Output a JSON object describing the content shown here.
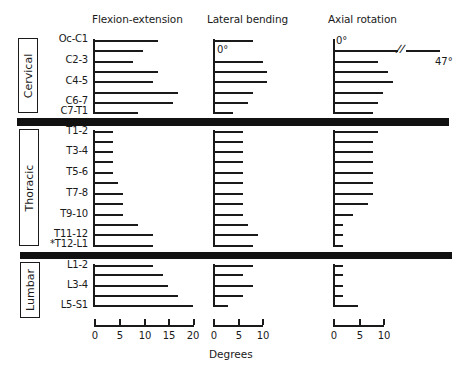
{
  "chart_data": {
    "type": "bar",
    "orientation": "horizontal",
    "title": "",
    "xlabel": "Degrees",
    "ylabel": "",
    "regions": [
      {
        "name": "Cervical",
        "levels": [
          "Oc-C1",
          "C1-2",
          "C2-3",
          "C3-4",
          "C4-5",
          "C5-6",
          "C6-7",
          "C7-T1"
        ]
      },
      {
        "name": "Thoracic",
        "levels": [
          "T1-2",
          "T2-3",
          "T3-4",
          "T4-5",
          "T5-6",
          "T6-7",
          "T7-8",
          "T8-9",
          "T9-10",
          "T10-11",
          "T11-12",
          "*T12-L1"
        ]
      },
      {
        "name": "Lumbar",
        "levels": [
          "L1-2",
          "L2-3",
          "L3-4",
          "L4-5",
          "L5-S1"
        ]
      }
    ],
    "categories": [
      "Oc-C1",
      "C1-2",
      "C2-3",
      "C3-4",
      "C4-5",
      "C5-6",
      "C6-7",
      "C7-T1",
      "T1-2",
      "T2-3",
      "T3-4",
      "T4-5",
      "T5-6",
      "T6-7",
      "T7-8",
      "T8-9",
      "T9-10",
      "T10-11",
      "T11-12",
      "T12-L1",
      "L1-2",
      "L2-3",
      "L3-4",
      "L4-5",
      "L5-S1"
    ],
    "series": [
      {
        "name": "Flexion-extension",
        "xlim": [
          0,
          20
        ],
        "ticks": [
          0,
          5,
          10,
          15,
          20
        ],
        "values": [
          13,
          10,
          8,
          13,
          12,
          17,
          16,
          9,
          4,
          4,
          4,
          4,
          4,
          5,
          6,
          6,
          6,
          9,
          12,
          12,
          12,
          14,
          15,
          17,
          20
        ]
      },
      {
        "name": "Lateral bending",
        "xlim": [
          0,
          10
        ],
        "ticks": [
          0,
          5,
          10
        ],
        "values": [
          8,
          0,
          10,
          11,
          11,
          8,
          7,
          4,
          6,
          6,
          6,
          6,
          6,
          6,
          6,
          6,
          6,
          7,
          9,
          8,
          8,
          6,
          8,
          6,
          3
        ]
      },
      {
        "name": "Axial rotation",
        "xlim": [
          0,
          10
        ],
        "ticks": [
          0,
          5,
          10
        ],
        "values": [
          0,
          47,
          9,
          11,
          12,
          10,
          9,
          8,
          9,
          8,
          8,
          8,
          8,
          8,
          8,
          7,
          4,
          2,
          2,
          2,
          2,
          2,
          2,
          2,
          5
        ]
      }
    ],
    "annotations": [
      "0°",
      "0°",
      "47°"
    ],
    "grid": false,
    "legend": "none"
  },
  "headers": {
    "flexion": "Flexion-extension",
    "lateral": "Lateral bending",
    "axial": "Axial rotation"
  },
  "regions": {
    "cervical": "Cervical",
    "thoracic": "Thoracic",
    "lumbar": "Lumbar"
  },
  "level_labels": {
    "oc_c1": "Oc-C1",
    "c2_3": "C2-3",
    "c4_5": "C4-5",
    "c6_7": "C6-7",
    "c7_t1": "C7-T1",
    "t1_2": "T1-2",
    "t3_4": "T3-4",
    "t5_6": "T5-6",
    "t7_8": "T7-8",
    "t9_10": "T9-10",
    "t11_12": "T11-12",
    "t12_l1": "*T12-L1",
    "l1_2": "L1-2",
    "l3_4": "L3-4",
    "l5_s1": "L5-S1"
  },
  "notes": {
    "lateral_zero": "0°",
    "axial_zero": "0°",
    "axial_47": "47°",
    "break_mark": "//"
  },
  "axes": {
    "flexion_ticks": [
      "0",
      "5",
      "10",
      "15",
      "20"
    ],
    "lateral_ticks": [
      "0",
      "5",
      "10"
    ],
    "axial_ticks": [
      "0",
      "5",
      "10"
    ],
    "xlabel": "Degrees"
  }
}
